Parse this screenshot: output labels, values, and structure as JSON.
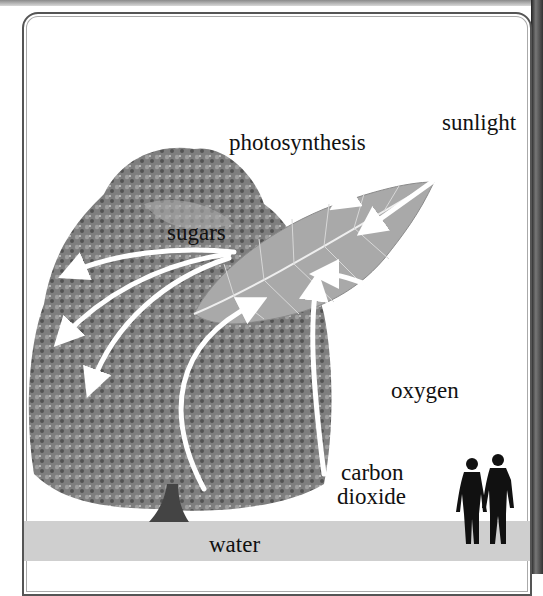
{
  "diagram": {
    "labels": {
      "sunlight": "sunlight",
      "photosynthesis": "photosynthesis",
      "sugars": "sugars",
      "oxygen": "oxygen",
      "carbon_line1": "carbon",
      "carbon_line2": "dioxide",
      "water": "water"
    },
    "elements": [
      "tree",
      "leaf",
      "white arrows",
      "human silhouettes",
      "ground band"
    ],
    "colors": {
      "ground": "#cfcfcf",
      "arrow": "#ffffff",
      "foliage": "#6b6b6b",
      "leaf": "#a9a9a9",
      "silhouette": "#111111"
    }
  }
}
